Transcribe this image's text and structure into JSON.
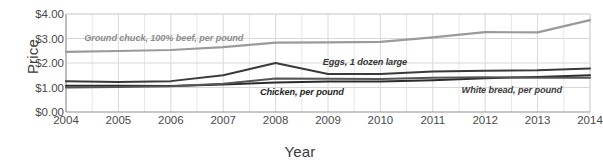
{
  "chart_data": {
    "type": "line",
    "title": "",
    "xlabel": "Year",
    "ylabel": "Price",
    "x": [
      2004,
      2005,
      2006,
      2007,
      2008,
      2009,
      2010,
      2011,
      2012,
      2013,
      2014
    ],
    "xlim": [
      2004,
      2014
    ],
    "ylim": [
      0,
      4
    ],
    "yticks": [
      "$0.00",
      "$1.00",
      "$2.00",
      "$3.00",
      "$4.00"
    ],
    "ytick_values": [
      0,
      1,
      2,
      3,
      4
    ],
    "xticks": [
      "2004",
      "2005",
      "2006",
      "2007",
      "2008",
      "2009",
      "2010",
      "2011",
      "2012",
      "2013",
      "2014"
    ],
    "grid": true,
    "minor_grid_per_interval": 2,
    "legend": "inline-annotations",
    "series": [
      {
        "name": "Ground chuck, 100% beef, per pound",
        "color": "#9a9a9a",
        "values": [
          2.45,
          2.49,
          2.53,
          2.65,
          2.83,
          2.84,
          2.86,
          3.05,
          3.26,
          3.25,
          3.75
        ],
        "label_x": 2004.35,
        "label_y": 3.0,
        "label_color": "#8c8c8c"
      },
      {
        "name": "Eggs, 1 dozen large",
        "color": "#3a3a3a",
        "values": [
          1.26,
          1.22,
          1.26,
          1.5,
          2.0,
          1.55,
          1.55,
          1.65,
          1.68,
          1.7,
          1.78
        ],
        "label_x": 2008.9,
        "label_y": 2.02,
        "label_color": "#333333"
      },
      {
        "name": "Chicken, per pound",
        "color": "#2b2b2b",
        "values": [
          1.07,
          1.07,
          1.06,
          1.12,
          1.2,
          1.25,
          1.25,
          1.3,
          1.38,
          1.43,
          1.5
        ],
        "label_x": 2007.7,
        "label_y": 0.78,
        "label_color": "#262626"
      },
      {
        "name": "White bread, per pound",
        "color": "#555555",
        "values": [
          1.0,
          1.02,
          1.05,
          1.15,
          1.37,
          1.36,
          1.35,
          1.4,
          1.42,
          1.4,
          1.4
        ],
        "label_x": 2011.55,
        "label_y": 0.86,
        "label_color": "#3d3d3d"
      }
    ]
  },
  "axes": {
    "y_title": "Price",
    "x_title": "Year"
  },
  "colors": {
    "grid": "#d8d8d8",
    "axis": "#8f8f8f",
    "text": "#3a3a3a"
  }
}
